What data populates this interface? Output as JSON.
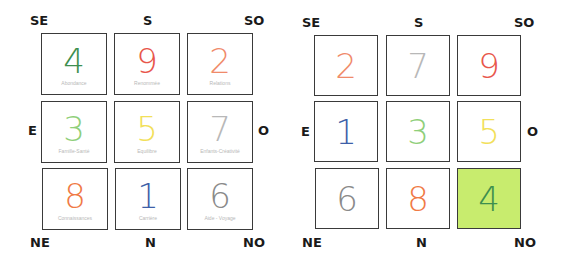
{
  "directions": {
    "top_left": "SE",
    "top_mid": "S",
    "top_right": "SO",
    "mid_left": "E",
    "mid_right": "O",
    "bottom_left": "NE",
    "bottom_mid": "N",
    "bottom_right": "NO"
  },
  "left_grid": {
    "cells": [
      {
        "number": "4",
        "label": "Abondance",
        "color": "#3d8f4f"
      },
      {
        "number": "9",
        "label": "Renommée",
        "color": "#e8564a"
      },
      {
        "number": "2",
        "label": "Relations",
        "color": "#f08a6a"
      },
      {
        "number": "3",
        "label": "Famille-Santé",
        "color": "#8fcf7a"
      },
      {
        "number": "5",
        "label": "Equilibre",
        "color": "#f2e05a"
      },
      {
        "number": "7",
        "label": "Enfants-Créativité",
        "color": "#b8b8b8"
      },
      {
        "number": "8",
        "label": "Connaissances",
        "color": "#f07a45"
      },
      {
        "number": "1",
        "label": "Carrière",
        "color": "#3e5fa8"
      },
      {
        "number": "6",
        "label": "Aide - Voyage",
        "color": "#8a8a8a"
      }
    ]
  },
  "right_grid": {
    "cells": [
      {
        "number": "2",
        "color": "#f08a6a",
        "bg": "#ffffff"
      },
      {
        "number": "7",
        "color": "#b8b8b8",
        "bg": "#ffffff"
      },
      {
        "number": "9",
        "color": "#e8564a",
        "bg": "#ffffff"
      },
      {
        "number": "1",
        "color": "#3e5fa8",
        "bg": "#ffffff"
      },
      {
        "number": "3",
        "color": "#8fcf7a",
        "bg": "#ffffff"
      },
      {
        "number": "5",
        "color": "#f2e05a",
        "bg": "#ffffff"
      },
      {
        "number": "6",
        "color": "#8a8a8a",
        "bg": "#ffffff"
      },
      {
        "number": "8",
        "color": "#f07a45",
        "bg": "#ffffff"
      },
      {
        "number": "4",
        "color": "#3d8f4f",
        "bg": "#c8ec6e"
      }
    ]
  }
}
